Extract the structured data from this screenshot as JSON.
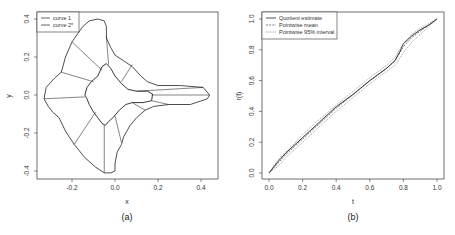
{
  "chart_data": [
    {
      "type": "line",
      "panel_label": "(a)",
      "xlabel": "x",
      "ylabel": "y",
      "xlim": [
        -0.36,
        0.47
      ],
      "ylim": [
        -0.44,
        0.44
      ],
      "xticks": [
        -0.2,
        0.0,
        0.2,
        0.4
      ],
      "xtick_labels": [
        "-0.2",
        "0.0",
        "0.2",
        "0.4"
      ],
      "yticks": [
        -0.4,
        -0.2,
        0.0,
        0.2,
        0.4
      ],
      "ytick_labels": [
        "-0.4",
        "-0.2",
        "0.0",
        "0.2",
        "0.4"
      ],
      "grid": false,
      "legend": {
        "placement": "top-left",
        "entries": [
          {
            "label": "curve 1",
            "style": "solid"
          },
          {
            "label": "curve 2*",
            "style": "solid"
          }
        ]
      },
      "series": [
        {
          "name": "curve 1",
          "closed": true,
          "points": [
            [
              -0.33,
              -0.02
            ],
            [
              -0.32,
              0.04
            ],
            [
              -0.28,
              0.09
            ],
            [
              -0.25,
              0.12
            ],
            [
              -0.23,
              0.2
            ],
            [
              -0.2,
              0.28
            ],
            [
              -0.15,
              0.36
            ],
            [
              -0.12,
              0.39
            ],
            [
              -0.08,
              0.4
            ],
            [
              -0.05,
              0.39
            ],
            [
              -0.04,
              0.36
            ],
            [
              -0.04,
              0.3
            ],
            [
              -0.02,
              0.25
            ],
            [
              0.0,
              0.21
            ],
            [
              0.04,
              0.18
            ],
            [
              0.08,
              0.15
            ],
            [
              0.12,
              0.1
            ],
            [
              0.15,
              0.07
            ],
            [
              0.2,
              0.05
            ],
            [
              0.3,
              0.05
            ],
            [
              0.41,
              0.04
            ],
            [
              0.44,
              0.0
            ],
            [
              0.43,
              -0.02
            ],
            [
              0.35,
              -0.05
            ],
            [
              0.25,
              -0.05
            ],
            [
              0.18,
              -0.06
            ],
            [
              0.14,
              -0.08
            ],
            [
              0.1,
              -0.12
            ],
            [
              0.07,
              -0.16
            ],
            [
              0.04,
              -0.22
            ],
            [
              0.03,
              -0.26
            ],
            [
              0.01,
              -0.3
            ],
            [
              0.0,
              -0.36
            ],
            [
              0.0,
              -0.4
            ],
            [
              -0.02,
              -0.41
            ],
            [
              -0.05,
              -0.41
            ],
            [
              -0.09,
              -0.38
            ],
            [
              -0.14,
              -0.33
            ],
            [
              -0.19,
              -0.26
            ],
            [
              -0.23,
              -0.19
            ],
            [
              -0.26,
              -0.12
            ],
            [
              -0.29,
              -0.09
            ],
            [
              -0.31,
              -0.06
            ]
          ]
        },
        {
          "name": "curve 2*",
          "closed": true,
          "points": [
            [
              -0.14,
              0.0
            ],
            [
              -0.13,
              0.04
            ],
            [
              -0.11,
              0.07
            ],
            [
              -0.08,
              0.1
            ],
            [
              -0.06,
              0.15
            ],
            [
              -0.04,
              0.165
            ],
            [
              -0.02,
              0.14
            ],
            [
              0.0,
              0.1
            ],
            [
              0.03,
              0.06
            ],
            [
              0.06,
              0.03
            ],
            [
              0.1,
              0.02
            ],
            [
              0.15,
              0.02
            ],
            [
              0.175,
              0.005
            ],
            [
              0.17,
              -0.03
            ],
            [
              0.13,
              -0.04
            ],
            [
              0.08,
              -0.04
            ],
            [
              0.05,
              -0.05
            ],
            [
              0.02,
              -0.08
            ],
            [
              -0.01,
              -0.12
            ],
            [
              -0.03,
              -0.14
            ],
            [
              -0.045,
              -0.16
            ],
            [
              -0.06,
              -0.15
            ],
            [
              -0.08,
              -0.12
            ],
            [
              -0.1,
              -0.09
            ],
            [
              -0.12,
              -0.05
            ],
            [
              -0.13,
              -0.02
            ]
          ]
        }
      ],
      "correspondence_lines": [
        [
          [
            -0.33,
            -0.02
          ],
          [
            -0.14,
            -0.01
          ]
        ],
        [
          [
            -0.25,
            0.12
          ],
          [
            -0.1,
            0.07
          ]
        ],
        [
          [
            -0.2,
            0.28
          ],
          [
            -0.06,
            0.13
          ]
        ],
        [
          [
            -0.04,
            0.31
          ],
          [
            -0.03,
            0.16
          ]
        ],
        [
          [
            0.08,
            0.16
          ],
          [
            0.03,
            0.07
          ]
        ],
        [
          [
            0.41,
            0.04
          ],
          [
            0.1,
            0.02
          ]
        ],
        [
          [
            0.44,
            0.0
          ],
          [
            0.17,
            0.0
          ]
        ],
        [
          [
            0.25,
            -0.05
          ],
          [
            0.17,
            -0.03
          ]
        ],
        [
          [
            0.14,
            -0.08
          ],
          [
            0.08,
            -0.04
          ]
        ],
        [
          [
            0.03,
            -0.25
          ],
          [
            0.0,
            -0.11
          ]
        ],
        [
          [
            -0.05,
            -0.41
          ],
          [
            -0.05,
            -0.16
          ]
        ],
        [
          [
            -0.19,
            -0.26
          ],
          [
            -0.09,
            -0.09
          ]
        ]
      ]
    },
    {
      "type": "line",
      "panel_label": "(b)",
      "xlabel": "t",
      "ylabel": "r(t)",
      "xlim": [
        -0.03,
        1.03
      ],
      "ylim": [
        -0.04,
        1.04
      ],
      "xticks": [
        0.0,
        0.2,
        0.4,
        0.6,
        0.8,
        1.0
      ],
      "xtick_labels": [
        "0.0",
        "0.2",
        "0.4",
        "0.6",
        "0.8",
        "1.0"
      ],
      "yticks": [
        0.0,
        0.2,
        0.4,
        0.6,
        0.8,
        1.0
      ],
      "ytick_labels": [
        "0.0",
        "0.2",
        "0.4",
        "0.6",
        "0.8",
        "1.0"
      ],
      "grid": false,
      "legend": {
        "placement": "top-left",
        "entries": [
          {
            "label": "Quotient estimate",
            "style": "solid"
          },
          {
            "label": "Pointwise mean",
            "style": "dashed"
          },
          {
            "label": "Pointwise 95% interval",
            "style": "dotted"
          }
        ]
      },
      "series": [
        {
          "name": "Quotient estimate",
          "style": "solid",
          "x": [
            0.0,
            0.05,
            0.1,
            0.15,
            0.2,
            0.3,
            0.4,
            0.5,
            0.6,
            0.7,
            0.75,
            0.78,
            0.8,
            0.85,
            0.9,
            0.95,
            1.0
          ],
          "y": [
            0.0,
            0.07,
            0.13,
            0.18,
            0.23,
            0.33,
            0.43,
            0.51,
            0.6,
            0.68,
            0.73,
            0.79,
            0.84,
            0.89,
            0.93,
            0.96,
            1.0
          ]
        },
        {
          "name": "Pointwise mean",
          "style": "dashed",
          "x": [
            0.0,
            0.05,
            0.1,
            0.15,
            0.2,
            0.3,
            0.4,
            0.5,
            0.6,
            0.7,
            0.75,
            0.8,
            0.85,
            0.9,
            0.95,
            1.0
          ],
          "y": [
            0.0,
            0.06,
            0.12,
            0.17,
            0.22,
            0.32,
            0.42,
            0.51,
            0.6,
            0.68,
            0.73,
            0.82,
            0.88,
            0.92,
            0.96,
            1.0
          ]
        },
        {
          "name": "Pointwise 95% upper",
          "style": "dotted",
          "x": [
            0.0,
            0.05,
            0.1,
            0.15,
            0.2,
            0.3,
            0.4,
            0.5,
            0.6,
            0.7,
            0.75,
            0.8,
            0.85,
            0.9,
            0.95,
            1.0
          ],
          "y": [
            0.0,
            0.08,
            0.14,
            0.19,
            0.25,
            0.35,
            0.44,
            0.53,
            0.62,
            0.7,
            0.75,
            0.84,
            0.9,
            0.94,
            0.97,
            1.0
          ]
        },
        {
          "name": "Pointwise 95% lower",
          "style": "dotted",
          "x": [
            0.0,
            0.05,
            0.1,
            0.15,
            0.2,
            0.3,
            0.4,
            0.5,
            0.6,
            0.7,
            0.75,
            0.8,
            0.85,
            0.9,
            0.95,
            1.0
          ],
          "y": [
            0.0,
            0.04,
            0.1,
            0.15,
            0.2,
            0.3,
            0.4,
            0.49,
            0.58,
            0.66,
            0.7,
            0.78,
            0.85,
            0.9,
            0.95,
            1.0
          ]
        }
      ]
    }
  ]
}
